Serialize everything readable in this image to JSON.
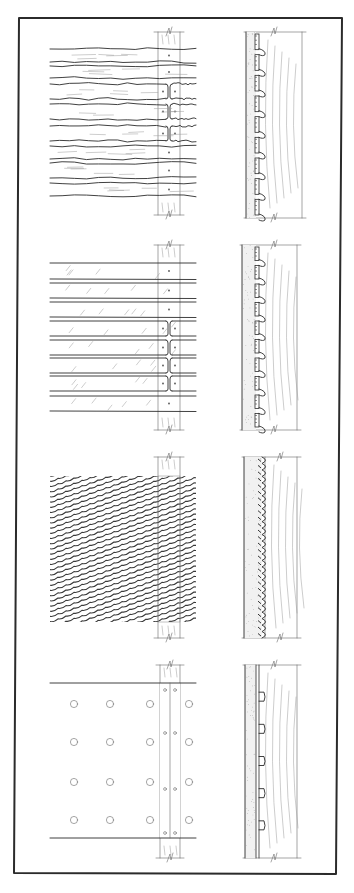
{
  "figure": {
    "width": 354,
    "height": 893,
    "background": "#ffffff",
    "ink_color": "#2b2b2b",
    "grain_color": "#9a9a9a",
    "plaster_fill": "#f1f1f1",
    "frame": {
      "points": [
        [
          19,
          18
        ],
        [
          342,
          18
        ],
        [
          336,
          874
        ],
        [
          14,
          873
        ]
      ],
      "stroke_width": 2
    }
  },
  "panels": [
    {
      "id": "wood-lath-rough",
      "label": "Split wood lath (irregular)",
      "elevation": {
        "x0": 50,
        "x1": 196,
        "stud": {
          "x": 158,
          "w": 22,
          "top": 32,
          "bottom": 215
        },
        "laths": [
          [
            49,
            62
          ],
          [
            66,
            78
          ],
          [
            84,
            99
          ],
          [
            104,
            119
          ],
          [
            126,
            141
          ],
          [
            146,
            159
          ],
          [
            163,
            178
          ],
          [
            183,
            196
          ]
        ],
        "butt_joint_rows": [
          2,
          3,
          4
        ],
        "nail_rows": [
          0,
          1,
          5,
          6,
          7
        ],
        "wavy": true
      },
      "section": {
        "x_plaster": 246,
        "x_lath": 256,
        "x_stud_right": 302,
        "top": 32,
        "bottom": 218,
        "keys": 9,
        "profile": "lath-keys"
      }
    },
    {
      "id": "wood-lath-sawn",
      "label": "Sawn wood lath",
      "elevation": {
        "x0": 50,
        "x1": 196,
        "stud": {
          "x": 158,
          "w": 22,
          "top": 245,
          "bottom": 430
        },
        "laths": [
          [
            263,
            279
          ],
          [
            283,
            298
          ],
          [
            302,
            317
          ],
          [
            321,
            336
          ],
          [
            340,
            355
          ],
          [
            358,
            373
          ],
          [
            376,
            391
          ],
          [
            396,
            411
          ]
        ],
        "butt_joint_rows": [
          3,
          4,
          5,
          6
        ],
        "nail_rows": [
          0,
          1,
          2,
          7
        ],
        "wavy": false
      },
      "section": {
        "x_plaster": 242,
        "x_lath": 256,
        "x_stud_right": 297,
        "top": 245,
        "bottom": 430,
        "keys": 10,
        "profile": "lath-keys"
      }
    },
    {
      "id": "metal-lath",
      "label": "Expanded metal lath",
      "elevation": {
        "x0": 50,
        "x1": 196,
        "stud": {
          "x": 158,
          "w": 22,
          "top": 457,
          "bottom": 638
        },
        "mesh": {
          "top": 476,
          "bottom": 622,
          "spacing": 5.2,
          "slope": -0.35
        }
      },
      "section": {
        "x_plaster": 244,
        "x_lath": 262,
        "x_stud_right": 297,
        "top": 457,
        "bottom": 638,
        "keys": 28,
        "profile": "mesh-twist"
      }
    },
    {
      "id": "gypsum-lath",
      "label": "Perforated gypsum lath",
      "elevation": {
        "x0": 50,
        "x1": 196,
        "stud": {
          "x": 160,
          "w": 20,
          "top": 665,
          "bottom": 858
        },
        "board": {
          "top": 683,
          "bottom": 838,
          "joint_x": 170
        },
        "holes": {
          "cols": [
            74,
            110,
            150,
            189
          ],
          "rows": [
            704,
            742,
            782,
            820
          ],
          "r": 3.6
        },
        "nails": {
          "xs": [
            165,
            175
          ],
          "ys": [
            690,
            733,
            789,
            833
          ],
          "r": 1.4
        }
      },
      "section": {
        "x_plaster": 245,
        "x_lath": 256,
        "x_stud_right": 297,
        "top": 665,
        "bottom": 858,
        "keys": 5,
        "profile": "board-keys"
      }
    }
  ]
}
